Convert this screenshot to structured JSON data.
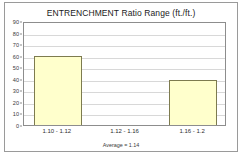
{
  "chart_data": {
    "type": "bar",
    "title": "ENTRENCHMENT Ratio Range (ft./ft.)",
    "xlabel": "",
    "ylabel": "",
    "categories": [
      "1.10 - 1.12",
      "1.12 - 1.16",
      "1.16 - 1.2"
    ],
    "values": [
      60,
      0,
      39
    ],
    "ylim": [
      0,
      90
    ],
    "ytick_step": 10,
    "yticks": [
      0,
      10,
      20,
      30,
      40,
      50,
      60,
      70,
      80,
      90
    ],
    "ytick_labels": [
      "0",
      "10",
      "20",
      "30",
      "40",
      "50",
      "60",
      "70",
      "80",
      "90"
    ],
    "grid": true,
    "grid_axis": "y",
    "legend": false,
    "annotation": "Average = 1.14",
    "bar_fill_color": "#FFFFCC",
    "bar_border_color": "#7D7B4F",
    "plot_border_color": "#8D8D8D",
    "gridline_color": "#D8D8D8",
    "frame_color": "#9A9A9A",
    "background_color": "#FFFFFF"
  }
}
